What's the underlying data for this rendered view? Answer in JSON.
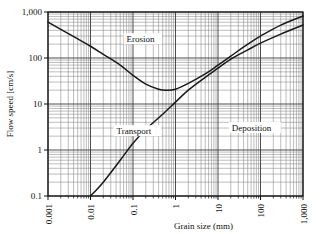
{
  "figure": {
    "kind": "hjulstrom-diagram",
    "background": "#ffffff",
    "line_color": "#1a1a1a",
    "grid_color": "#7a7a7a",
    "axis_color": "#111111"
  },
  "chart_data": {
    "type": "line",
    "title": "",
    "subtitle": "",
    "xlabel": "Grain size (mm)",
    "ylabel": "Flow speed [cm/s]",
    "xscale": "log",
    "yscale": "log",
    "xlim": [
      0.001,
      1000
    ],
    "ylim": [
      0.1,
      1000
    ],
    "grid": true,
    "grid_minor": true,
    "legend_position": "none",
    "xticks": [
      0.001,
      0.01,
      0.1,
      1,
      10,
      100,
      1000
    ],
    "xticklabels": [
      "0.001",
      "0.01",
      "0.1",
      "1",
      "10",
      "100",
      "1,000"
    ],
    "xticklabel_rotation": -90,
    "yticks": [
      0.1,
      1,
      10,
      100,
      1000
    ],
    "yticklabels": [
      "0.1",
      "1",
      "10",
      "100",
      "1,000"
    ],
    "annotations": [
      {
        "text": "Erosion",
        "x": 0.06,
        "y": 220
      },
      {
        "text": "Transport",
        "x": 0.035,
        "y": 2.2
      },
      {
        "text": "Deposition",
        "x": 18,
        "y": 2.6
      }
    ],
    "series": [
      {
        "name": "Erosion (critical erosion velocity)",
        "points": [
          [
            0.001,
            600
          ],
          [
            0.002,
            420
          ],
          [
            0.005,
            260
          ],
          [
            0.01,
            180
          ],
          [
            0.02,
            120
          ],
          [
            0.05,
            70
          ],
          [
            0.1,
            42
          ],
          [
            0.2,
            27
          ],
          [
            0.4,
            21
          ],
          [
            0.6,
            20
          ],
          [
            1,
            21
          ],
          [
            2,
            28
          ],
          [
            5,
            45
          ],
          [
            10,
            70
          ],
          [
            20,
            110
          ],
          [
            50,
            200
          ],
          [
            100,
            300
          ],
          [
            300,
            520
          ],
          [
            1000,
            820
          ]
        ]
      },
      {
        "name": "Deposition (settling velocity)",
        "points": [
          [
            0.01,
            0.1
          ],
          [
            0.02,
            0.2
          ],
          [
            0.05,
            0.6
          ],
          [
            0.1,
            1.4
          ],
          [
            0.2,
            2.8
          ],
          [
            0.5,
            6
          ],
          [
            1,
            11
          ],
          [
            2,
            20
          ],
          [
            5,
            38
          ],
          [
            10,
            60
          ],
          [
            20,
            95
          ],
          [
            50,
            150
          ],
          [
            100,
            210
          ],
          [
            300,
            330
          ],
          [
            1000,
            520
          ]
        ]
      }
    ]
  }
}
